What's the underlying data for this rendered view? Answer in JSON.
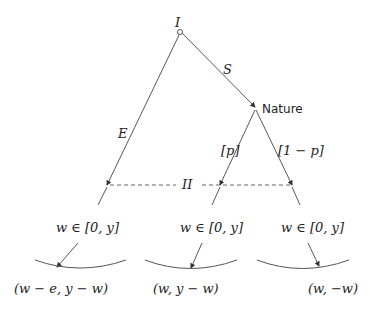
{
  "diagram": {
    "root_label": "I",
    "edge_labels": {
      "left": "E",
      "right": "S",
      "nature_left": "[p]",
      "nature_right": "[1 − p]"
    },
    "nature_label": "Nature",
    "info_set_label": "II",
    "choice_labels": [
      "w ∈ [0, y]",
      "w ∈ [0, y]",
      "w ∈ [0, y]"
    ],
    "payoffs": [
      "(w − e, y − w)",
      "(w, y − w)",
      "(w, −w)"
    ]
  }
}
